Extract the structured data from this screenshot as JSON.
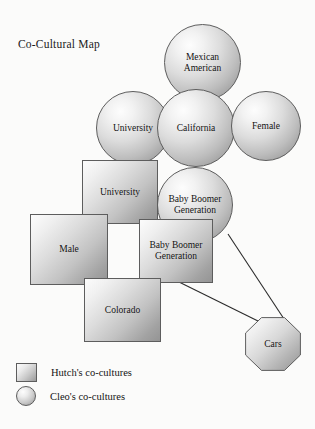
{
  "figure": {
    "title": "Co-Cultural Map",
    "type": "venn-overlap-map"
  },
  "nodes": {
    "mexican_american": {
      "label": "Mexican American",
      "shape": "circle",
      "owner": "Cleo"
    },
    "university_circle": {
      "label": "University",
      "shape": "circle",
      "owner": "Cleo"
    },
    "california": {
      "label": "California",
      "shape": "circle",
      "owner": "Cleo"
    },
    "female": {
      "label": "Female",
      "shape": "circle",
      "owner": "Cleo"
    },
    "baby_boomer_circle": {
      "label": "Baby Boomer Generation",
      "shape": "circle",
      "owner": "Cleo"
    },
    "university_rect": {
      "label": "University",
      "shape": "rectangle",
      "owner": "Hutch"
    },
    "male": {
      "label": "Male",
      "shape": "rectangle",
      "owner": "Hutch"
    },
    "baby_boomer_rect": {
      "label": "Baby Boomer Generation",
      "shape": "rectangle",
      "owner": "Hutch"
    },
    "colorado": {
      "label": "Colorado",
      "shape": "rectangle",
      "owner": "Hutch"
    },
    "cars": {
      "label": "Cars",
      "shape": "octagon",
      "owner": "shared"
    }
  },
  "legend": {
    "items": [
      {
        "label": "Hutch's co-cultures",
        "swatch": "square"
      },
      {
        "label": "Cleo's co-cultures",
        "swatch": "circle"
      }
    ]
  },
  "colors": {
    "background": "#fbfbfa",
    "outline": "#5d5d5d",
    "text": "#111111",
    "fill_light": "#fcfcfc",
    "fill_dark": "#8c8c8c"
  }
}
